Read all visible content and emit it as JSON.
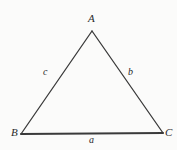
{
  "figure": {
    "kind": "triangle-diagram",
    "background_color": "#fbfbfa",
    "stroke_color": "#3a3a3a",
    "label_color": "#2a2a2a"
  },
  "vertices": [
    {
      "id": "A",
      "label": "A",
      "x": 92,
      "y": 31
    },
    {
      "id": "B",
      "label": "B",
      "x": 21,
      "y": 134
    },
    {
      "id": "C",
      "label": "C",
      "x": 163,
      "y": 133
    }
  ],
  "sides": [
    {
      "id": "a",
      "label": "a",
      "from": "B",
      "to": "C",
      "opposite_vertex": "A",
      "stroke_width": 2
    },
    {
      "id": "b",
      "label": "b",
      "from": "A",
      "to": "C",
      "opposite_vertex": "B",
      "stroke_width": 1.3
    },
    {
      "id": "c",
      "label": "c",
      "from": "A",
      "to": "B",
      "opposite_vertex": "C",
      "stroke_width": 1.3
    }
  ]
}
